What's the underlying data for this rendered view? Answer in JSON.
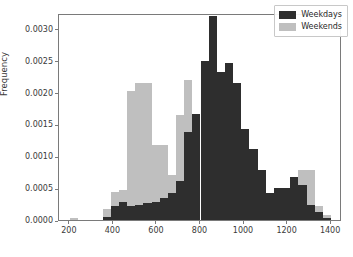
{
  "chart_data": {
    "type": "bar",
    "subtype": "histogram-overlay",
    "title": "",
    "xlabel": "",
    "ylabel": "Frequency",
    "xlim": [
      150,
      1450
    ],
    "ylim": [
      0.0,
      0.00325
    ],
    "grid": false,
    "legend_position": "upper right",
    "xticks": [
      200,
      400,
      600,
      800,
      1000,
      1200,
      1400
    ],
    "xtick_labels": [
      "200",
      "400",
      "600",
      "800",
      "1000",
      "1200",
      "1400"
    ],
    "yticks": [
      0.0,
      0.0005,
      0.001,
      0.0015,
      0.002,
      0.0025,
      0.003
    ],
    "ytick_labels": [
      "0.0000",
      "0.0005",
      "0.0010",
      "0.0015",
      "0.0020",
      "0.0025",
      "0.0030"
    ],
    "bin_width": 37.5,
    "bin_edges": [
      200,
      237.5,
      275,
      312.5,
      350,
      387.5,
      425,
      462.5,
      500,
      537.5,
      575,
      612.5,
      650,
      687.5,
      725,
      762.5,
      800,
      837.5,
      875,
      912.5,
      950,
      987.5,
      1025,
      1062.5,
      1100,
      1137.5,
      1175,
      1212.5,
      1250,
      1287.5,
      1325,
      1362.5,
      1400
    ],
    "series": [
      {
        "name": "Weekdays",
        "color": "#2e2e2e",
        "values": [
          0.0,
          0.0,
          0.0,
          0.0,
          5e-05,
          0.00022,
          0.00029,
          0.00022,
          0.00024,
          0.00026,
          0.00028,
          0.00035,
          0.00042,
          0.00062,
          0.00138,
          0.00167,
          0.0025,
          0.00321,
          0.00233,
          0.00247,
          0.00215,
          0.00143,
          0.00111,
          0.00079,
          0.00043,
          0.00051,
          0.00051,
          0.00067,
          0.00055,
          0.00023,
          0.00012,
          3e-05
        ]
      },
      {
        "name": "Weekends",
        "color": "#bfbfbf",
        "values": [
          3e-05,
          0.0,
          0.0,
          0.0,
          0.00017,
          0.00044,
          0.00047,
          0.00202,
          0.00215,
          0.00215,
          0.00117,
          0.00117,
          0.00071,
          0.00165,
          0.0022,
          0.00167,
          0.00132,
          0.00062,
          0.00031,
          0.00018,
          0.00012,
          8e-05,
          5e-05,
          4e-05,
          0.0,
          0.0,
          0.0,
          6e-05,
          0.00078,
          0.00078,
          0.00022,
          8e-05
        ]
      }
    ],
    "legend_entries": [
      {
        "label": "Weekdays",
        "color": "#2e2e2e"
      },
      {
        "label": "Weekends",
        "color": "#bfbfbf"
      }
    ]
  }
}
